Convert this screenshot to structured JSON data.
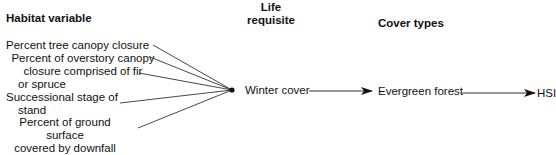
{
  "headers": {
    "habitat_variable": "Habitat variable",
    "life_requisite_line1": "Life",
    "life_requisite_line2": "requisite",
    "cover_types": "Cover types"
  },
  "habitat_variables": [
    {
      "lines": [
        "Percent tree canopy closure"
      ]
    },
    {
      "lines": [
        "Percent of overstory canopy",
        "closure comprised of fir",
        "or spruce"
      ]
    },
    {
      "lines": [
        "Successional stage of",
        "stand"
      ]
    },
    {
      "lines": [
        "Percent of ground surface",
        "covered by downfall"
      ]
    }
  ],
  "life_requisite": "Winter cover",
  "cover_type": "Evergreen forest",
  "output": "HSI",
  "colors": {
    "line": "#333333",
    "text": "#111111",
    "background": "#ffffff"
  }
}
